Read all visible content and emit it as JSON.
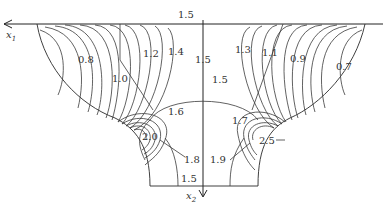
{
  "figure": {
    "type": "contour-diagram",
    "axes": {
      "x1": {
        "label": "x",
        "subscript": "1",
        "direction": "left"
      },
      "x2": {
        "label": "x",
        "subscript": "2",
        "direction": "down"
      }
    },
    "contour_labels": {
      "top_center": "1.5",
      "left_08": "0.8",
      "left_10": "1.0",
      "left_12": "1.2",
      "left_14": "1.4",
      "center_15_vertical": "1.5",
      "center_15_arc": "1.5",
      "left_16": "1.6",
      "left_20": "2.0",
      "left_18": "1.8",
      "bottom_15": "1.5",
      "right_13": "1.3",
      "right_11": "1.1",
      "right_09": "0.9",
      "right_07": "0.7",
      "right_17": "1.7",
      "right_19": "1.9",
      "right_25": "2.5"
    }
  }
}
